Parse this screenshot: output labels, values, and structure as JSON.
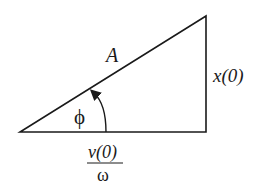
{
  "diagram": {
    "type": "right-triangle phasor diagram",
    "labels": {
      "hypotenuse": "A",
      "vertical_side": "x(0)",
      "angle": "ϕ",
      "base_numerator": "v(0)",
      "base_denominator": "ω"
    },
    "vertices": {
      "left": [
        20,
        132
      ],
      "right_bottom": [
        206,
        132
      ],
      "right_top": [
        206,
        16
      ]
    },
    "stroke_color": "#1a1a1a"
  }
}
